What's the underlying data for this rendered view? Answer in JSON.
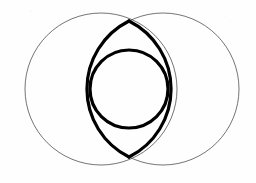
{
  "figure": {
    "background_color": "#fefefe",
    "stroke_color": "#000000",
    "canvas": {
      "width": 256,
      "height": 183
    },
    "elements": {
      "left_circle": {
        "label": "left outer circle",
        "cx": 101,
        "cy": 89,
        "r": 76,
        "stroke_width": 0.7,
        "stroke_color": "#3a3a3a",
        "fill": "none"
      },
      "right_circle": {
        "label": "right outer circle",
        "cx": 163,
        "cy": 89,
        "r": 76,
        "stroke_width": 0.7,
        "stroke_color": "#3a3a3a",
        "fill": "none"
      },
      "vesica_lens": {
        "label": "vesica piscis lens",
        "top_point_x": 129,
        "top_point_y": 21,
        "bottom_point_x": 129,
        "bottom_point_y": 157,
        "left_bulge_x": 87,
        "right_bulge_x": 171,
        "stroke_width": 3.2,
        "stroke_color": "#000000",
        "fill": "none"
      },
      "inner_circle": {
        "label": "inscribed inner circle",
        "cx": 129,
        "cy": 89,
        "r": 39,
        "stroke_width": 3.2,
        "stroke_color": "#000000",
        "fill": "none"
      }
    }
  },
  "chart_data": {
    "type": "scatter",
    "xlabel": "",
    "ylabel": "",
    "xlim": [
      0,
      256
    ],
    "ylim": [
      0,
      183
    ],
    "grid": false,
    "legend": "none",
    "shapes": [
      {
        "name": "left outer circle",
        "kind": "circle",
        "cx": 101,
        "cy": 89,
        "r": 76,
        "line_width": "thin"
      },
      {
        "name": "right outer circle",
        "kind": "circle",
        "cx": 163,
        "cy": 89,
        "r": 76,
        "line_width": "thin"
      },
      {
        "name": "vesica lens",
        "kind": "lens",
        "cx": 129,
        "cy": 89,
        "half_height": 68,
        "half_width": 42,
        "line_width": "thick"
      },
      {
        "name": "inner circle",
        "kind": "circle",
        "cx": 129,
        "cy": 89,
        "r": 39,
        "line_width": "thick"
      }
    ],
    "intersection_points": [
      {
        "label": "upper intersection",
        "x": 129,
        "y": 21
      },
      {
        "label": "lower intersection",
        "x": 129,
        "y": 157
      }
    ]
  }
}
